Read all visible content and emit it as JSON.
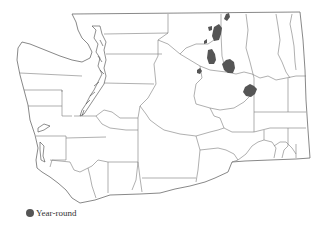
{
  "map": {
    "region": "Washington State",
    "boundaries": "counties",
    "colors": {
      "background": "#ffffff",
      "boundary": "#7a7a7a",
      "shaded_area": "#555555"
    },
    "shaded_areas": [
      {
        "id": "ne-blob-1",
        "category": "Year-round"
      },
      {
        "id": "ne-blob-2",
        "category": "Year-round"
      },
      {
        "id": "ne-blob-3",
        "category": "Year-round"
      },
      {
        "id": "ne-blob-4",
        "category": "Year-round"
      },
      {
        "id": "ne-blob-5",
        "category": "Year-round"
      },
      {
        "id": "confluence-blob",
        "category": "Year-round"
      },
      {
        "id": "east-blob",
        "category": "Year-round"
      }
    ]
  },
  "legend": {
    "items": [
      {
        "label": "Year-round",
        "color": "#555555",
        "symbol": "filled-circle"
      }
    ]
  }
}
